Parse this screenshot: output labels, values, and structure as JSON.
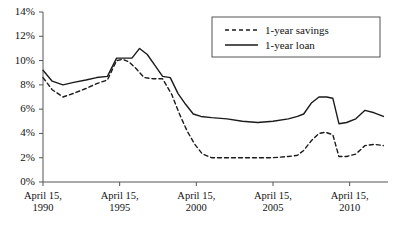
{
  "chart_data": {
    "type": "line",
    "title": "",
    "xlabel": "",
    "ylabel": "",
    "grid": false,
    "legend_position": "top-right",
    "ylim": [
      0,
      14
    ],
    "xlim": [
      1990,
      2012.5
    ],
    "ytick_labels": [
      "0%",
      "2%",
      "4%",
      "6%",
      "8%",
      "10%",
      "12%",
      "14%"
    ],
    "ytick_values": [
      0,
      2,
      4,
      6,
      8,
      10,
      12,
      14
    ],
    "xtick_labels": [
      {
        "line1": "April 15,",
        "line2": "1990"
      },
      {
        "line1": "April 15,",
        "line2": "1995"
      },
      {
        "line1": "April 15,",
        "line2": "2000"
      },
      {
        "line1": "April 15,",
        "line2": "2005"
      },
      {
        "line1": "April 15,",
        "line2": "2010"
      }
    ],
    "xtick_values": [
      1990,
      1995,
      2000,
      2005,
      2010
    ],
    "series": [
      {
        "name": "1-year savings",
        "style": "dashed",
        "color": "#1a1a1a",
        "x": [
          1990.0,
          1990.6,
          1991.3,
          1992.0,
          1992.8,
          1993.5,
          1994.2,
          1994.8,
          1995.2,
          1995.6,
          1996.1,
          1996.6,
          1997.2,
          1997.8,
          1998.4,
          1998.9,
          1999.4,
          1999.9,
          2000.4,
          2001.0,
          2002.0,
          2003.0,
          2004.0,
          2005.0,
          2006.0,
          2006.6,
          2007.0,
          2007.5,
          2008.0,
          2008.4,
          2008.9,
          2009.3,
          2009.8,
          2010.4,
          2011.0,
          2011.6,
          2012.2
        ],
        "values": [
          8.6,
          7.6,
          7.0,
          7.3,
          7.7,
          8.1,
          8.4,
          10.0,
          10.1,
          9.9,
          9.3,
          8.6,
          8.5,
          8.5,
          7.2,
          5.6,
          4.2,
          3.1,
          2.3,
          2.0,
          2.0,
          2.0,
          2.0,
          2.0,
          2.1,
          2.2,
          2.6,
          3.4,
          4.0,
          4.1,
          3.9,
          2.1,
          2.1,
          2.3,
          3.0,
          3.1,
          3.0
        ]
      },
      {
        "name": "1-year loan",
        "style": "solid",
        "color": "#1a1a1a",
        "x": [
          1990.0,
          1990.6,
          1991.3,
          1992.0,
          1992.8,
          1993.5,
          1994.2,
          1994.8,
          1995.2,
          1995.8,
          1996.3,
          1996.8,
          1997.3,
          1997.8,
          1998.3,
          1998.8,
          1999.3,
          1999.8,
          2000.3,
          2001.0,
          2002.0,
          2003.0,
          2004.0,
          2005.0,
          2006.0,
          2006.6,
          2007.0,
          2007.5,
          2008.0,
          2008.5,
          2008.9,
          2009.3,
          2009.8,
          2010.4,
          2011.0,
          2011.6,
          2012.2
        ],
        "values": [
          9.2,
          8.3,
          8.0,
          8.2,
          8.4,
          8.6,
          8.7,
          10.2,
          10.2,
          10.2,
          11.0,
          10.5,
          9.6,
          8.7,
          8.6,
          7.3,
          6.4,
          5.6,
          5.4,
          5.3,
          5.2,
          5.0,
          4.9,
          5.0,
          5.2,
          5.4,
          5.6,
          6.5,
          7.0,
          7.0,
          6.9,
          4.8,
          4.9,
          5.2,
          5.9,
          5.7,
          5.4
        ]
      }
    ]
  },
  "legend": {
    "items": [
      {
        "label": "1-year savings",
        "style": "dashed"
      },
      {
        "label": "1-year loan",
        "style": "solid"
      }
    ]
  }
}
